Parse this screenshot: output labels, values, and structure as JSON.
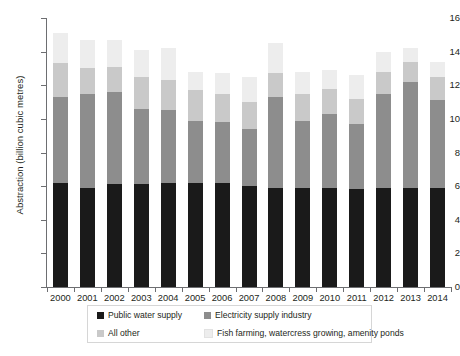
{
  "chart_data": {
    "type": "bar",
    "stacked": true,
    "title": "",
    "xlabel": "",
    "ylabel": "Abstraction (billion cubic metres)",
    "ylim": [
      0,
      16
    ],
    "ytick_step": 2,
    "yticks": [
      "0",
      "2",
      "4",
      "6",
      "8",
      "10",
      "12",
      "14",
      "16"
    ],
    "grid": false,
    "legend_position": "bottom",
    "categories": [
      "2000",
      "2001",
      "2002",
      "2003",
      "2004",
      "2005",
      "2006",
      "2007",
      "2008",
      "2009",
      "2010",
      "2011",
      "2012",
      "2013",
      "2014"
    ],
    "series": [
      {
        "name": "Public water supply",
        "color": "#1a1a1a",
        "values": [
          6.2,
          5.9,
          6.1,
          6.1,
          6.2,
          6.2,
          6.2,
          6.0,
          5.9,
          5.9,
          5.9,
          5.8,
          5.9,
          5.9,
          5.9
        ]
      },
      {
        "name": "Electricity supply industry",
        "color": "#8d8d8d",
        "values": [
          5.1,
          5.6,
          5.5,
          4.5,
          4.3,
          3.7,
          3.6,
          3.4,
          5.4,
          4.0,
          4.4,
          3.9,
          5.6,
          6.3,
          5.2
        ]
      },
      {
        "name": "All other",
        "color": "#c9c9c9",
        "values": [
          2.0,
          1.5,
          1.5,
          1.9,
          1.8,
          1.8,
          1.7,
          1.6,
          1.4,
          1.6,
          1.5,
          1.5,
          1.3,
          1.2,
          1.4
        ]
      },
      {
        "name": "Fish farming, watercress growing, amenity ponds",
        "color": "#ededed",
        "values": [
          1.8,
          1.7,
          1.6,
          1.6,
          1.9,
          1.1,
          1.2,
          1.5,
          1.8,
          1.3,
          1.1,
          1.4,
          1.2,
          0.8,
          0.9
        ]
      }
    ],
    "totals": [
      15.1,
      14.7,
      14.7,
      14.1,
      14.2,
      12.8,
      12.7,
      12.5,
      14.5,
      12.8,
      12.9,
      12.6,
      14.0,
      14.2,
      13.4
    ]
  },
  "legend": {
    "entries": [
      {
        "label": "Public water supply",
        "color": "#1a1a1a"
      },
      {
        "label": "Electricity supply industry",
        "color": "#8d8d8d"
      },
      {
        "label": "All other",
        "color": "#c9c9c9"
      },
      {
        "label": "Fish farming, watercress growing, amenity ponds",
        "color": "#ededed"
      }
    ]
  }
}
